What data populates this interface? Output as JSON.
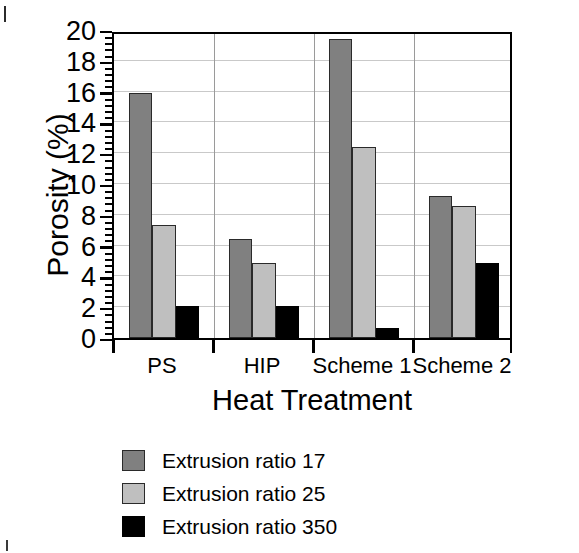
{
  "chart_data": {
    "type": "bar",
    "title": "",
    "subtitle": "",
    "xlabel": "Heat Treatment",
    "ylabel": "Porosity (%)",
    "ylim": [
      0,
      20
    ],
    "ytick_step": 2,
    "ytick_labels": [
      "0",
      "2",
      "4",
      "6",
      "8",
      "10",
      "12",
      "14",
      "16",
      "18",
      "20"
    ],
    "y_minor_ticks_per_interval": 4,
    "grid": "horizontal",
    "legend_position": "below-axis-left",
    "categories": [
      "PS",
      "HIP",
      "Scheme 1",
      "Scheme 2"
    ],
    "series": [
      {
        "name": "Extrusion ratio 17",
        "color": "#808080",
        "values": [
          15.9,
          6.4,
          19.4,
          9.2
        ]
      },
      {
        "name": "Extrusion ratio 25",
        "color": "#bfbfbf",
        "values": [
          7.35,
          4.85,
          12.4,
          8.6
        ]
      },
      {
        "name": "Extrusion ratio 350",
        "color": "#000000",
        "values": [
          2.05,
          2.1,
          0.65,
          4.9
        ]
      }
    ]
  },
  "axes": {
    "y_title": "Porosity (%)",
    "x_title": "Heat Treatment",
    "y_labels": [
      "20",
      "18",
      "16",
      "14",
      "12",
      "10",
      "8",
      "6",
      "4",
      "2",
      "0"
    ],
    "x_labels": [
      "PS",
      "HIP",
      "Scheme 1",
      "Scheme 2"
    ]
  },
  "legend": {
    "items": [
      {
        "label": "Extrusion ratio 17",
        "color": "#808080"
      },
      {
        "label": "Extrusion ratio 25",
        "color": "#bfbfbf"
      },
      {
        "label": "Extrusion ratio 350",
        "color": "#000000"
      }
    ]
  },
  "colors": {
    "series_dark_gray": "#808080",
    "series_light_gray": "#bfbfbf",
    "series_black": "#000000",
    "frame": "#000000",
    "gridline": "#c9c9c9",
    "group_divider": "#9a9a9a",
    "background": "#ffffff"
  }
}
